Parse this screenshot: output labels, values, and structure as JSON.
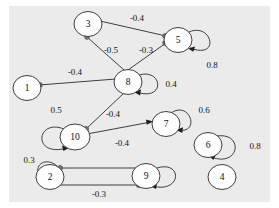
{
  "figure": {
    "kind": "directed-weighted-graph",
    "background_color": "#ebebeb",
    "outer_background_color": "#ffffff",
    "node_fill_color": "#fdfdfd",
    "stroke_color": "#2b2b2b",
    "endpoint_dot_color": "#7a7a7a",
    "width": 279,
    "height": 208
  },
  "nodes": [
    {
      "id": "1",
      "label": "1",
      "cx": 27,
      "cy": 88,
      "r": 13
    },
    {
      "id": "2",
      "label": "2",
      "cx": 50,
      "cy": 177,
      "r": 13
    },
    {
      "id": "3",
      "label": "3",
      "cx": 88,
      "cy": 24,
      "r": 13
    },
    {
      "id": "4",
      "label": "4",
      "cx": 222,
      "cy": 177,
      "r": 13
    },
    {
      "id": "5",
      "label": "5",
      "cx": 178,
      "cy": 40,
      "r": 13
    },
    {
      "id": "6",
      "label": "6",
      "cx": 208,
      "cy": 145,
      "r": 13
    },
    {
      "id": "7",
      "label": "7",
      "cx": 166,
      "cy": 124,
      "r": 13
    },
    {
      "id": "8",
      "label": "8",
      "cx": 128,
      "cy": 82,
      "r": 13
    },
    {
      "id": "9",
      "label": "9",
      "cx": 146,
      "cy": 176,
      "r": 13
    },
    {
      "id": "10",
      "label": "10",
      "cx": 75,
      "cy": 137,
      "r": 13
    }
  ],
  "edges": [
    {
      "from": "3",
      "to": "5",
      "weight": "-0.4",
      "label_x": 137,
      "label_y": 18
    },
    {
      "from": "3",
      "to": "8",
      "weight": "-0.5",
      "label_x": 111,
      "label_y": 50
    },
    {
      "from": "8",
      "to": "5",
      "weight": "-0.3",
      "label_x": 146,
      "label_y": 50
    },
    {
      "from": "1",
      "to": "8",
      "weight": "-0.4",
      "label_x": 75,
      "label_y": 72
    },
    {
      "from": "8",
      "to": "10",
      "weight": "-0.4",
      "label_x": 113,
      "label_y": 114
    },
    {
      "from": "10",
      "to": "7",
      "weight": "-0.4",
      "label_x": 122,
      "label_y": 143
    },
    {
      "from": "2",
      "to": "9",
      "weight": "",
      "label_x": 98,
      "label_y": 160
    },
    {
      "from": "9",
      "to": "2",
      "weight": "-0.3",
      "label_x": 99,
      "label_y": 194
    }
  ],
  "self_loops": [
    {
      "node": "5",
      "weight": "0.8",
      "label_x": 212,
      "label_y": 65
    },
    {
      "node": "8",
      "weight": "0.4",
      "label_x": 171,
      "label_y": 84
    },
    {
      "node": "7",
      "weight": "0.6",
      "label_x": 204,
      "label_y": 110
    },
    {
      "node": "6",
      "weight": "0.8",
      "label_x": 255,
      "label_y": 146
    },
    {
      "node": "10",
      "weight": "0.5",
      "label_x": 56,
      "label_y": 110
    },
    {
      "node": "2",
      "weight": "0.3",
      "label_x": 29,
      "label_y": 160
    },
    {
      "node": "9",
      "weight": "",
      "label_x": 188,
      "label_y": 176
    }
  ],
  "legend": {
    "note": ""
  }
}
